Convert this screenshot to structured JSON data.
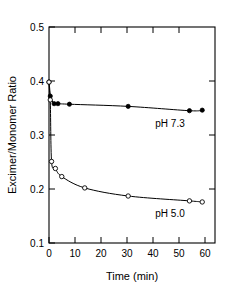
{
  "chart_data": {
    "type": "scatter",
    "title": "",
    "xlabel": "Time (min)",
    "ylabel": "Excimer/Monomer Ratio",
    "xlim": [
      0,
      65
    ],
    "ylim": [
      0.1,
      0.5
    ],
    "grid": false,
    "legend_position": "inline-annotation",
    "xticks": [
      0,
      10,
      20,
      30,
      40,
      50,
      60
    ],
    "xtick_labels": [
      "0",
      "10",
      "20",
      "30",
      "40",
      "50",
      "60"
    ],
    "yticks": [
      0.1,
      0.2,
      0.3,
      0.4,
      0.5
    ],
    "ytick_labels": [
      "0.1",
      "0.2",
      "0.3",
      "0.4",
      "0.5"
    ],
    "series": [
      {
        "name": "pH 7.3",
        "marker": "filled-circle",
        "annotation": "pH 7.3",
        "x": [
          0,
          0.5,
          2,
          3.5,
          8,
          31,
          55,
          60
        ],
        "y": [
          0.398,
          0.372,
          0.358,
          0.358,
          0.357,
          0.353,
          0.345,
          0.346
        ]
      },
      {
        "name": "pH 5.0",
        "marker": "open-circle",
        "annotation": "pH 5.0",
        "x": [
          0,
          0.5,
          1,
          2.5,
          5,
          14,
          31,
          55,
          60
        ],
        "y": [
          0.398,
          0.365,
          0.251,
          0.238,
          0.223,
          0.202,
          0.187,
          0.178,
          0.176
        ]
      }
    ]
  },
  "axes": {
    "y_title": "Excimer/Monomer Ratio",
    "x_title": "Time (min)",
    "x_tick_labels": [
      "0",
      "10",
      "20",
      "30",
      "40",
      "50",
      "60"
    ],
    "y_tick_labels": [
      "0.1",
      "0.2",
      "0.3",
      "0.4",
      "0.5"
    ]
  },
  "annotations": {
    "upper_series_label": "pH 7.3",
    "lower_series_label": "pH 5.0"
  },
  "colors": {
    "foreground": "#000000",
    "background": "#ffffff"
  }
}
